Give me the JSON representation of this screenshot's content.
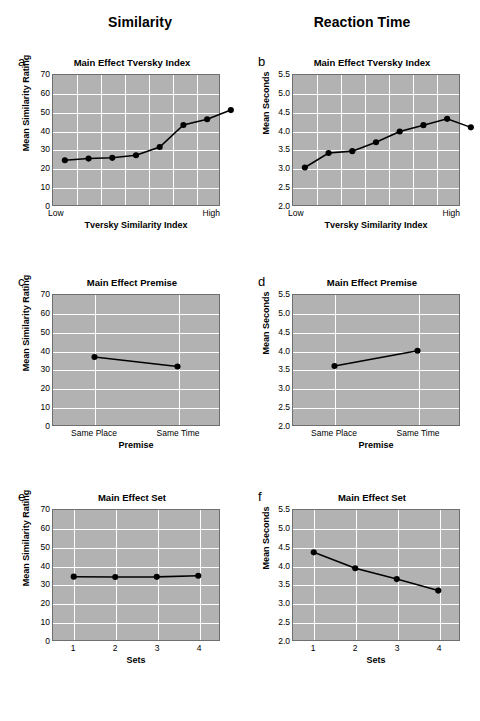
{
  "headers": {
    "left": "Similarity",
    "right": "Reaction Time"
  },
  "chart_data": [
    {
      "panel": "a",
      "type": "line",
      "title": "Main Effect Tversky Index",
      "xlabel": "Tversky Similarity Index",
      "ylabel": "Mean Similarity Rating",
      "ylim": [
        0,
        70
      ],
      "yticks": [
        0,
        10,
        20,
        30,
        40,
        50,
        60,
        70
      ],
      "ytick_labels": [
        "0",
        "10",
        "20",
        "30",
        "40",
        "50",
        "60",
        "70"
      ],
      "xtick_labels": [
        "Low",
        "High"
      ],
      "x": [
        1,
        2,
        3,
        4,
        5,
        6,
        7,
        8
      ],
      "values": [
        24.1,
        25.0,
        25.4,
        26.8,
        31.2,
        43.1,
        46.2,
        51.1
      ],
      "grid": true,
      "n_xgrid": 7
    },
    {
      "panel": "b",
      "type": "line",
      "title": "Main Effect Tversky Index",
      "xlabel": "Tversky Similarity Index",
      "ylabel": "Mean Seconds",
      "ylim": [
        2.0,
        5.5
      ],
      "yticks": [
        2.0,
        2.5,
        3.0,
        3.5,
        4.0,
        4.5,
        5.0,
        5.5
      ],
      "ytick_labels": [
        "2.0",
        "2.5",
        "3.0",
        "3.5",
        "4.0",
        "4.5",
        "5.0",
        "5.5"
      ],
      "xtick_labels": [
        "Low",
        "High"
      ],
      "x": [
        1,
        2,
        3,
        4,
        5,
        6,
        7,
        8
      ],
      "values": [
        3.01,
        3.4,
        3.45,
        3.69,
        3.98,
        4.15,
        4.32,
        4.09
      ],
      "grid": true,
      "n_xgrid": 7
    },
    {
      "panel": "c",
      "type": "line",
      "title": "Main Effect Premise",
      "xlabel": "Premise",
      "ylabel": "Mean Similarity Rating",
      "ylim": [
        0,
        70
      ],
      "yticks": [
        0,
        10,
        20,
        30,
        40,
        50,
        60,
        70
      ],
      "ytick_labels": [
        "0",
        "10",
        "20",
        "30",
        "40",
        "50",
        "60",
        "70"
      ],
      "xtick_labels": [
        "Same Place",
        "Same Time"
      ],
      "x": [
        1,
        2
      ],
      "values": [
        36.6,
        31.5
      ],
      "grid": true,
      "n_xgrid": 2
    },
    {
      "panel": "d",
      "type": "line",
      "title": "Main Effect Premise",
      "xlabel": "Premise",
      "ylabel": "Mean Seconds",
      "ylim": [
        2.0,
        5.5
      ],
      "yticks": [
        2.0,
        2.5,
        3.0,
        3.5,
        4.0,
        4.5,
        5.0,
        5.5
      ],
      "ytick_labels": [
        "2.0",
        "2.5",
        "3.0",
        "3.5",
        "4.0",
        "4.5",
        "5.0",
        "5.5"
      ],
      "xtick_labels": [
        "Same Place",
        "Same Time"
      ],
      "x": [
        1,
        2
      ],
      "values": [
        3.59,
        4.0
      ],
      "grid": true,
      "n_xgrid": 2
    },
    {
      "panel": "e",
      "type": "line",
      "title": "Main Effect Set",
      "xlabel": "Sets",
      "ylabel": "Mean Similarity Rating",
      "ylim": [
        0,
        70
      ],
      "yticks": [
        0,
        10,
        20,
        30,
        40,
        50,
        60,
        70
      ],
      "ytick_labels": [
        "0",
        "10",
        "20",
        "30",
        "40",
        "50",
        "60",
        "70"
      ],
      "xtick_labels": [
        "1",
        "2",
        "3",
        "4"
      ],
      "x": [
        1,
        2,
        3,
        4
      ],
      "values": [
        34.1,
        33.9,
        34.0,
        34.6
      ],
      "grid": true,
      "n_xgrid": 4
    },
    {
      "panel": "f",
      "type": "line",
      "title": "Main Effect Set",
      "xlabel": "Sets",
      "ylabel": "Mean Seconds",
      "ylim": [
        2.0,
        5.5
      ],
      "yticks": [
        2.0,
        2.5,
        3.0,
        3.5,
        4.0,
        4.5,
        5.0,
        5.5
      ],
      "ytick_labels": [
        "2.0",
        "2.5",
        "3.0",
        "3.5",
        "4.0",
        "4.5",
        "5.0",
        "5.5"
      ],
      "xtick_labels": [
        "1",
        "2",
        "3",
        "4"
      ],
      "x": [
        1,
        2,
        3,
        4
      ],
      "values": [
        4.36,
        3.93,
        3.64,
        3.33
      ],
      "grid": true,
      "n_xgrid": 4
    }
  ],
  "style": {
    "plot_background": "#b2b2b2",
    "gridline_color": "#ffffff",
    "series_color": "#000000",
    "axis_color": "#6f6f6f",
    "page_background": "#ffffff"
  }
}
